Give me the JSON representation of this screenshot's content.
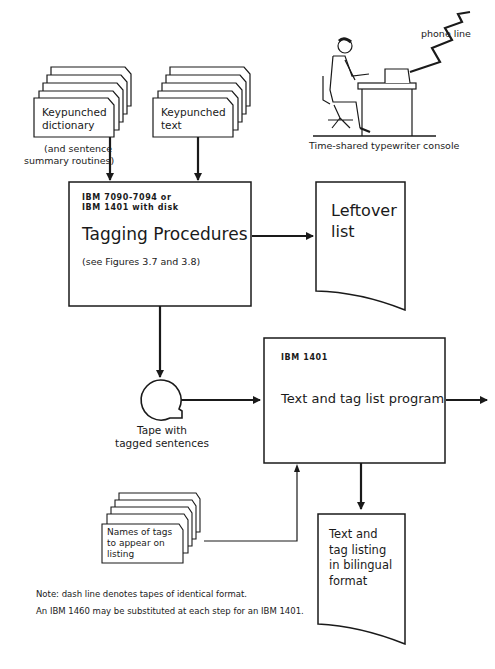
{
  "diagram": {
    "type": "flowchart",
    "nodes": {
      "dictionary_cards": {
        "shape": "card-deck",
        "label_lines": [
          "Keypunched",
          "dictionary"
        ],
        "note_lines": [
          "(and sentence",
          "summary routines)"
        ]
      },
      "text_cards": {
        "shape": "card-deck",
        "label_lines": [
          "Keypunched",
          "text"
        ]
      },
      "console": {
        "shape": "illustration",
        "caption": "Time-shared typewriter console",
        "connector_label": "phone line"
      },
      "tagging": {
        "shape": "process",
        "machine_lines": [
          "IBM 7090-7094 or",
          "IBM 1401 with disk"
        ],
        "title": "Tagging Procedures",
        "subtitle": "(see Figures 3.7 and 3.8)"
      },
      "leftover": {
        "shape": "document",
        "label_lines": [
          "Leftover",
          "list"
        ]
      },
      "tape": {
        "shape": "magnetic-tape",
        "label_lines": [
          "Tape with",
          "tagged sentences"
        ]
      },
      "text_tag_program": {
        "shape": "process",
        "machine": "IBM 1401",
        "title": "Text and tag list program"
      },
      "tag_names_cards": {
        "shape": "card-deck",
        "label_lines": [
          "Names of tags",
          "to appear on",
          "listing"
        ]
      },
      "bilingual_listing": {
        "shape": "document",
        "label_lines": [
          "Text and",
          "tag listing",
          "in bilingual",
          "format"
        ]
      }
    },
    "edges": [
      {
        "from": "dictionary_cards",
        "to": "tagging"
      },
      {
        "from": "text_cards",
        "to": "tagging"
      },
      {
        "from": "tagging",
        "to": "leftover"
      },
      {
        "from": "tagging",
        "to": "tape"
      },
      {
        "from": "tape",
        "to": "text_tag_program"
      },
      {
        "from": "tag_names_cards",
        "to": "text_tag_program"
      },
      {
        "from": "text_tag_program",
        "to": "bilingual_listing"
      },
      {
        "from": "text_tag_program",
        "to": "off-page-right"
      }
    ],
    "notes": [
      "Note: dash line denotes tapes of identical format.",
      "An IBM 1460 may be substituted at each step for an IBM 1401."
    ]
  }
}
